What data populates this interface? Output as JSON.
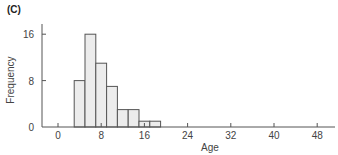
{
  "panel_label": "(C)",
  "chart_data": {
    "type": "bar",
    "title": "(C)",
    "xlabel": "Age",
    "ylabel": "Frequency",
    "bin_edges": [
      3,
      5,
      7,
      9,
      11,
      13,
      15,
      17,
      19
    ],
    "categories": [
      "3-5",
      "5-7",
      "7-9",
      "9-11",
      "11-13",
      "13-15",
      "15-17",
      "17-19"
    ],
    "values": [
      8,
      16,
      11,
      7,
      3,
      3,
      1,
      1
    ],
    "xlim": [
      -3,
      50
    ],
    "ylim": [
      0,
      18
    ],
    "xticks": [
      0,
      8,
      16,
      24,
      32,
      40,
      48
    ],
    "yticks": [
      0,
      8,
      16
    ],
    "grid": false,
    "legend": null
  },
  "colors": {
    "bar_fill": "#ececec",
    "bar_stroke": "#555555",
    "axis": "#555555"
  }
}
